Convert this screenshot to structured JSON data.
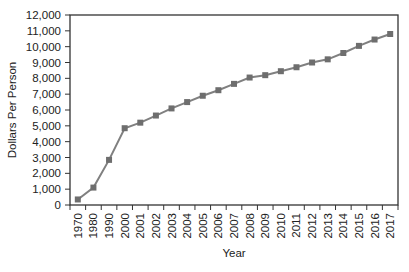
{
  "chart_data": {
    "type": "line",
    "title": "",
    "xlabel": "Year",
    "ylabel": "Dollars Per Person",
    "ylim": [
      0,
      12000
    ],
    "yticks": [
      0,
      1000,
      2000,
      3000,
      4000,
      5000,
      6000,
      7000,
      8000,
      9000,
      10000,
      11000,
      12000
    ],
    "ytick_labels": [
      "0",
      "1,000",
      "2,000",
      "3,000",
      "4,000",
      "5,000",
      "6,000",
      "7,000",
      "8,000",
      "9,000",
      "10,000",
      "11,000",
      "12,000"
    ],
    "grid": false,
    "legend": null,
    "categories": [
      "1970",
      "1980",
      "1990",
      "2000",
      "2001",
      "2002",
      "2003",
      "2004",
      "2005",
      "2006",
      "2007",
      "2008",
      "2009",
      "2010",
      "2011",
      "2012",
      "2013",
      "2014",
      "2015",
      "2016",
      "2017"
    ],
    "series": [
      {
        "name": "Dollars Per Person",
        "color": "#808080",
        "marker": "square",
        "values": [
          350,
          1100,
          2850,
          4850,
          5200,
          5650,
          6100,
          6500,
          6900,
          7250,
          7650,
          8050,
          8200,
          8450,
          8700,
          9000,
          9200,
          9600,
          10050,
          10450,
          10800
        ]
      }
    ]
  }
}
